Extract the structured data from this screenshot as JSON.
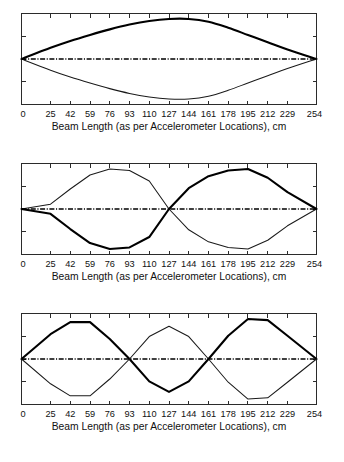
{
  "figure": {
    "name": "beam-mode-shapes-figure",
    "panel_count": 3,
    "background_color": "#ffffff",
    "line_color": "#000000"
  },
  "axis": {
    "title": "Beam Length (as per Accelerometer Locations), cm",
    "tick_labels": [
      "0",
      "25",
      "42",
      "59",
      "76",
      "93",
      "110",
      "127",
      "144",
      "161",
      "178",
      "195",
      "212",
      "229",
      "254"
    ],
    "units": "cm"
  },
  "chart_data": [
    {
      "type": "line",
      "title": "",
      "subtitle": "Mode 1 bending mode shape",
      "xlabel": "Beam Length (as per Accelerometer Locations), cm",
      "ylabel": "",
      "xlim": [
        0,
        254
      ],
      "ylim": [
        -1.15,
        1.15
      ],
      "grid": false,
      "legend": "none",
      "x": [
        0,
        25,
        42,
        59,
        76,
        93,
        110,
        127,
        144,
        161,
        178,
        195,
        212,
        229,
        254
      ],
      "xtick_labels": [
        "0",
        "25",
        "42",
        "59",
        "76",
        "93",
        "110",
        "127",
        "144",
        "161",
        "178",
        "195",
        "212",
        "229",
        "254"
      ],
      "series": [
        {
          "name": "Mode 1 (positive)",
          "style": "thick-solid",
          "values": [
            0.0,
            0.28,
            0.45,
            0.6,
            0.74,
            0.86,
            0.95,
            1.0,
            1.0,
            0.93,
            0.78,
            0.6,
            0.42,
            0.24,
            0.0
          ]
        },
        {
          "name": "Mode 1 (negative mirror)",
          "style": "thin-solid",
          "values": [
            0.0,
            -0.28,
            -0.45,
            -0.6,
            -0.74,
            -0.86,
            -0.95,
            -1.0,
            -1.0,
            -0.93,
            -0.78,
            -0.6,
            -0.42,
            -0.24,
            0.0
          ]
        },
        {
          "name": "Undeformed beam axis",
          "style": "dash-dot",
          "values": [
            0,
            0,
            0,
            0,
            0,
            0,
            0,
            0,
            0,
            0,
            0,
            0,
            0,
            0,
            0
          ]
        }
      ]
    },
    {
      "type": "line",
      "title": "",
      "subtitle": "Mode 2 bending mode shape",
      "xlabel": "Beam Length (as per Accelerometer Locations), cm",
      "ylabel": "",
      "xlim": [
        0,
        254
      ],
      "ylim": [
        -1.15,
        1.15
      ],
      "grid": false,
      "legend": "none",
      "x": [
        0,
        25,
        42,
        59,
        76,
        93,
        110,
        127,
        144,
        161,
        178,
        195,
        212,
        229,
        254
      ],
      "xtick_labels": [
        "0",
        "25",
        "42",
        "59",
        "76",
        "93",
        "110",
        "127",
        "144",
        "161",
        "178",
        "195",
        "212",
        "229",
        "254"
      ],
      "nodes": [
        127
      ],
      "series": [
        {
          "name": "Mode 2 (positive)",
          "style": "thin-solid",
          "values": [
            0.0,
            0.12,
            0.5,
            0.85,
            1.0,
            0.96,
            0.7,
            0.0,
            -0.52,
            -0.82,
            -0.96,
            -1.0,
            -0.78,
            -0.42,
            0.0
          ]
        },
        {
          "name": "Mode 2 (negative mirror)",
          "style": "thick-solid",
          "values": [
            0.0,
            -0.12,
            -0.5,
            -0.85,
            -1.0,
            -0.96,
            -0.7,
            0.0,
            0.52,
            0.82,
            0.96,
            1.0,
            0.78,
            0.42,
            0.0
          ]
        },
        {
          "name": "Undeformed beam axis",
          "style": "dash-dot",
          "values": [
            0,
            0,
            0,
            0,
            0,
            0,
            0,
            0,
            0,
            0,
            0,
            0,
            0,
            0,
            0
          ]
        }
      ]
    },
    {
      "type": "line",
      "title": "",
      "subtitle": "Mode 3 bending mode shape",
      "xlabel": "Beam Length (as per Accelerometer Locations), cm",
      "ylabel": "",
      "xlim": [
        0,
        254
      ],
      "ylim": [
        -1.15,
        1.15
      ],
      "grid": false,
      "legend": "none",
      "x": [
        0,
        25,
        42,
        59,
        76,
        93,
        110,
        127,
        144,
        161,
        178,
        195,
        212,
        229,
        254
      ],
      "xtick_labels": [
        "0",
        "25",
        "42",
        "59",
        "76",
        "93",
        "110",
        "127",
        "144",
        "161",
        "178",
        "195",
        "212",
        "229",
        "254"
      ],
      "nodes": [
        85,
        163
      ],
      "series": [
        {
          "name": "Mode 3 (positive)",
          "style": "thick-solid",
          "values": [
            0.0,
            0.62,
            0.92,
            0.92,
            0.5,
            0.0,
            -0.56,
            -0.82,
            -0.56,
            0.0,
            0.58,
            1.0,
            0.97,
            0.58,
            0.0
          ]
        },
        {
          "name": "Mode 3 (negative mirror)",
          "style": "thin-solid",
          "values": [
            0.0,
            -0.62,
            -0.92,
            -0.92,
            -0.5,
            0.0,
            0.56,
            0.82,
            0.56,
            0.0,
            -0.58,
            -1.0,
            -0.97,
            -0.58,
            0.0
          ]
        },
        {
          "name": "Undeformed beam axis",
          "style": "dash-dot",
          "values": [
            0,
            0,
            0,
            0,
            0,
            0,
            0,
            0,
            0,
            0,
            0,
            0,
            0,
            0,
            0
          ]
        }
      ]
    }
  ]
}
